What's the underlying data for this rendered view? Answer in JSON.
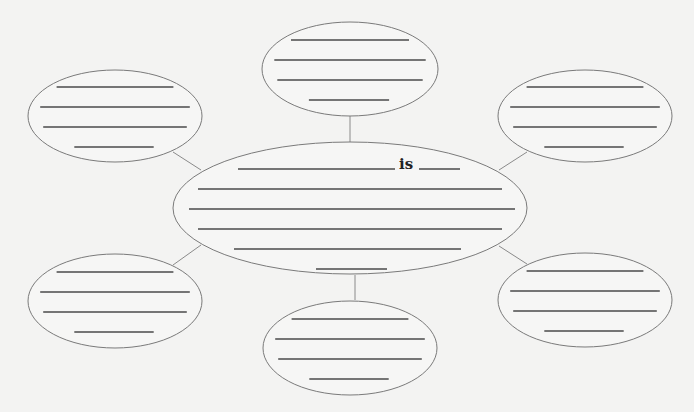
{
  "diagram": {
    "type": "word-web",
    "center_label": "is",
    "center": {
      "cx": 350,
      "cy": 208,
      "rx": 177,
      "ry": 66,
      "lines": [
        {
          "x1": 238,
          "x2": 395,
          "y": 169
        },
        {
          "x1": 419,
          "x2": 460,
          "y": 169
        },
        {
          "x1": 198,
          "x2": 502,
          "y": 189
        },
        {
          "x1": 189,
          "x2": 515,
          "y": 209
        },
        {
          "x1": 198,
          "x2": 502,
          "y": 229
        },
        {
          "x1": 234,
          "x2": 461,
          "y": 249
        },
        {
          "x1": 316,
          "x2": 387,
          "y": 269
        }
      ]
    },
    "satellites": [
      {
        "name": "top-left",
        "cx": 115,
        "cy": 116,
        "rx": 87,
        "ry": 46
      },
      {
        "name": "top",
        "cx": 350,
        "cy": 69,
        "rx": 88,
        "ry": 47
      },
      {
        "name": "top-right",
        "cx": 585,
        "cy": 116,
        "rx": 87,
        "ry": 46
      },
      {
        "name": "bottom-left",
        "cx": 115,
        "cy": 301,
        "rx": 87,
        "ry": 47
      },
      {
        "name": "bottom",
        "cx": 350,
        "cy": 348,
        "rx": 87,
        "ry": 47
      },
      {
        "name": "bottom-right",
        "cx": 585,
        "cy": 300,
        "rx": 87,
        "ry": 47
      }
    ],
    "connectors": [
      {
        "name": "top-left",
        "x1": 173,
        "y1": 152,
        "x2": 201,
        "y2": 170
      },
      {
        "name": "top",
        "x1": 350,
        "y1": 116,
        "x2": 350,
        "y2": 142
      },
      {
        "name": "top-right",
        "x1": 527,
        "y1": 152,
        "x2": 499,
        "y2": 170
      },
      {
        "name": "bottom-left",
        "x1": 173,
        "y1": 265,
        "x2": 201,
        "y2": 245
      },
      {
        "name": "bottom",
        "x1": 355,
        "y1": 275,
        "x2": 355,
        "y2": 300
      },
      {
        "name": "bottom-right",
        "x1": 527,
        "y1": 264,
        "x2": 499,
        "y2": 246
      }
    ],
    "satellite_line_count": 4,
    "colors": {
      "background": "#f3f3f2",
      "ellipse_stroke": "#7a7a7a",
      "blank_line": "#4a4a4a"
    }
  }
}
